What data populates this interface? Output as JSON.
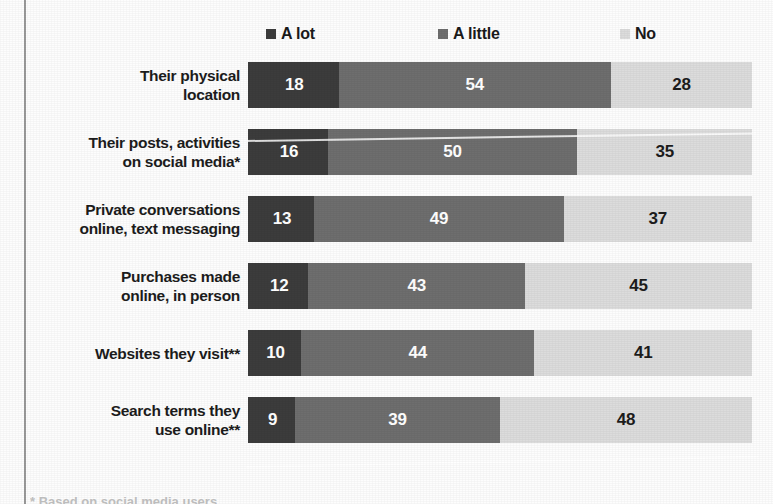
{
  "legend": {
    "items": [
      {
        "label": "A lot",
        "color": "#3c3c3c",
        "icon": "square-swatch-icon"
      },
      {
        "label": "A little",
        "color": "#6e6e6e",
        "icon": "square-swatch-icon"
      },
      {
        "label": "No",
        "color": "#dcdcdc",
        "icon": "square-swatch-icon"
      }
    ]
  },
  "footnote": {
    "text": "* Based on social media users"
  },
  "chart_data": {
    "type": "bar",
    "orientation": "horizontal",
    "stacked": true,
    "normalized": true,
    "title": "",
    "subtitle": "",
    "xlabel": "",
    "ylabel": "",
    "xlim": [
      0,
      100
    ],
    "grid": false,
    "legend_position": "top",
    "categories": [
      "Their physical location",
      "Their posts, activities on social media*",
      "Private conversations online, text messaging",
      "Purchases made online, in person",
      "Websites they visit**",
      "Search terms they use online**"
    ],
    "category_lines": [
      [
        "Their physical",
        "location"
      ],
      [
        "Their posts, activities",
        "on social media*"
      ],
      [
        "Private conversations",
        "online, text messaging"
      ],
      [
        "Purchases made",
        "online, in person"
      ],
      [
        "Websites they visit**"
      ],
      [
        "Search terms they",
        "use online**"
      ]
    ],
    "series": [
      {
        "name": "A lot",
        "color": "#3c3c3c",
        "values": [
          18,
          16,
          13,
          12,
          10,
          9
        ]
      },
      {
        "name": "A little",
        "color": "#6e6e6e",
        "values": [
          54,
          50,
          49,
          43,
          44,
          39
        ]
      },
      {
        "name": "No",
        "color": "#dcdcdc",
        "values": [
          28,
          35,
          37,
          45,
          41,
          48
        ]
      }
    ]
  }
}
